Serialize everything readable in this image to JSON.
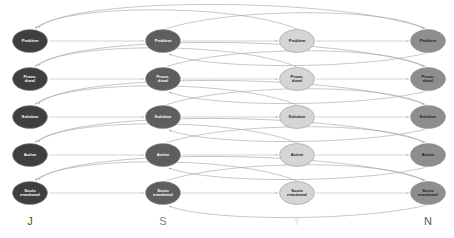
{
  "diagram": {
    "type": "state-transition-network",
    "title": "",
    "background_color": "#ffffff",
    "width": 454,
    "height": 238,
    "columns": [
      {
        "id": "J",
        "label": "J",
        "x": 30,
        "fill": "#3f3f3f",
        "label_color": "#ffffff",
        "axis_label_color": "#4a4a4a"
      },
      {
        "id": "S",
        "label": "S",
        "x": 163,
        "fill": "#5e5e5e",
        "label_color": "#ffffff",
        "axis_label_color": "#7d7d7d"
      },
      {
        "id": "Y",
        "label": "Y",
        "x": 297,
        "fill": "#d5d5d5",
        "label_color": "#1a1a1a",
        "axis_label_color": "#e2e2e2"
      },
      {
        "id": "N",
        "label": "N",
        "x": 428,
        "fill": "#8e8e8e",
        "label_color": "#1a1a1a",
        "axis_label_color": "#565656"
      }
    ],
    "rows": [
      {
        "id": "problem",
        "y": 41,
        "lines": [
          "Problem"
        ]
      },
      {
        "id": "procedural",
        "y": 79,
        "lines": [
          "Proce-",
          "dural"
        ]
      },
      {
        "id": "solution",
        "y": 117,
        "lines": [
          "Solution"
        ]
      },
      {
        "id": "active",
        "y": 155,
        "lines": [
          "Active"
        ]
      },
      {
        "id": "socio-emotional",
        "y": 193,
        "lines": [
          "Socio",
          "emotional"
        ]
      }
    ],
    "node_size": {
      "rx": 17.5,
      "ry": 11.5
    },
    "edges": {
      "straight_color": "#bdbdbd",
      "arc_color": "#a8a8a8",
      "arrow_color": "#b0b0b0",
      "description": "Horizontal arrows link adjacent columns; long curved arcs above and below connect distant columns back to earlier nodes."
    },
    "axis": {
      "y": 222,
      "labels": [
        "J",
        "S",
        "Y",
        "N"
      ]
    }
  }
}
